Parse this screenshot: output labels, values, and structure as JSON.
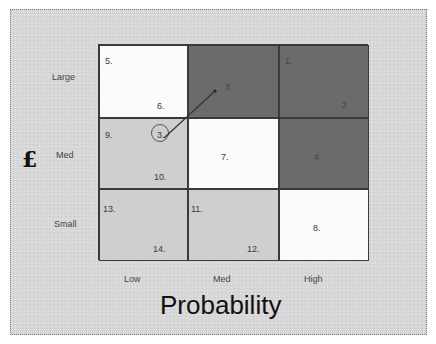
{
  "diagram": {
    "type": "risk-matrix",
    "y_axis": {
      "symbol": "£",
      "labels": [
        "Large",
        "Med",
        "Small"
      ]
    },
    "x_axis": {
      "title": "Probability",
      "labels": [
        "Low",
        "Med",
        "High"
      ]
    },
    "colors": {
      "low_risk": "#cfcfcf",
      "medium_risk": "#fbfbfb",
      "high_risk": "#6b6b6b",
      "panel_background": "#d8d8d8",
      "grid_line": "#3a3a3a"
    },
    "cells": [
      {
        "row": "Large",
        "col": "Low",
        "shade": "white",
        "items": [
          "5.",
          "6."
        ]
      },
      {
        "row": "Large",
        "col": "Med",
        "shade": "dark",
        "items": [
          "3"
        ]
      },
      {
        "row": "Large",
        "col": "High",
        "shade": "dark",
        "items": [
          "1.",
          "2"
        ]
      },
      {
        "row": "Med",
        "col": "Low",
        "shade": "light",
        "items": [
          "9.",
          "3.",
          "10."
        ]
      },
      {
        "row": "Med",
        "col": "Med",
        "shade": "white",
        "items": [
          "7."
        ]
      },
      {
        "row": "Med",
        "col": "High",
        "shade": "dark",
        "items": [
          "4"
        ]
      },
      {
        "row": "Small",
        "col": "Low",
        "shade": "light",
        "items": [
          "13.",
          "14."
        ]
      },
      {
        "row": "Small",
        "col": "Med",
        "shade": "light",
        "items": [
          "11.",
          "12."
        ]
      },
      {
        "row": "Small",
        "col": "High",
        "shade": "white",
        "items": [
          "8."
        ]
      }
    ],
    "annotation": {
      "circled_item": "3.",
      "arrow_from": "Med/Low",
      "arrow_to": "Large/Med",
      "arrow_target_label": "3"
    }
  }
}
